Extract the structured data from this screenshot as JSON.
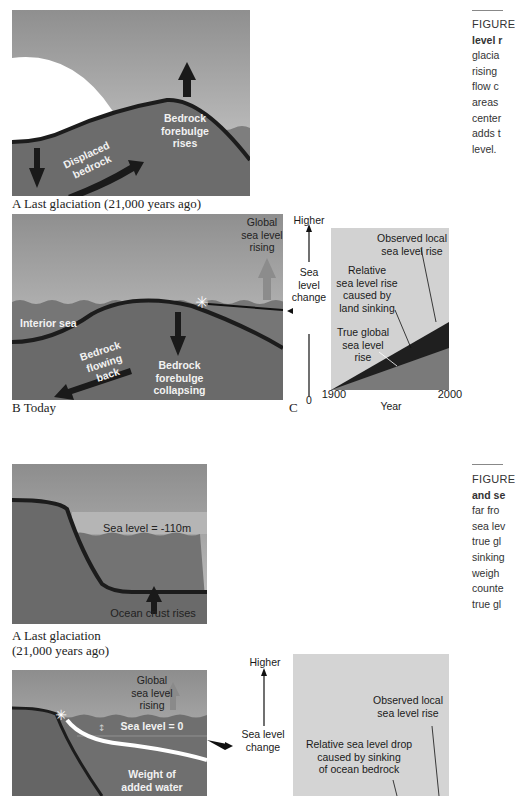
{
  "figure_top": {
    "panel_a": {
      "labels": {
        "forebulge": [
          "Bedrock",
          "forebulge",
          "rises"
        ],
        "displaced": [
          "Displaced",
          "bedrock"
        ]
      },
      "caption": "A  Last glaciation (21,000 years ago)"
    },
    "panel_b": {
      "labels": {
        "global_rise": [
          "Global",
          "sea level",
          "rising"
        ],
        "interior_sea": "Interior sea",
        "flowing_back": [
          "Bedrock",
          "flowing",
          "back"
        ],
        "collapsing": [
          "Bedrock",
          "forebulge",
          "collapsing"
        ]
      },
      "caption": "B  Today"
    },
    "panel_c": {
      "caption": "C",
      "axis_top": "Higher",
      "axis_label": [
        "Sea",
        "level",
        "change"
      ],
      "axis_zero": "0",
      "x_start": "1900",
      "x_end": "2000",
      "x_label": "Year",
      "annotations": {
        "observed": [
          "Observed local",
          "sea level rise"
        ],
        "relative": [
          "Relative",
          "sea level rise",
          "caused by",
          "land sinking"
        ],
        "true_global": [
          "True global",
          "sea level",
          "rise"
        ]
      }
    },
    "side_caption": {
      "title": "FIGURE",
      "lines": [
        "level r",
        "glacia",
        "rising",
        "flow c",
        "areas",
        "center",
        "adds t",
        "level."
      ]
    }
  },
  "figure_bottom": {
    "panel_a": {
      "labels": {
        "sea_level": "Sea level = -110m",
        "crust": "Ocean crust rises"
      },
      "caption_lines": [
        "A  Last glaciation",
        "(21,000 years ago)"
      ]
    },
    "panel_b": {
      "labels": {
        "global_rise": [
          "Global",
          "sea level",
          "rising"
        ],
        "sea_level": "Sea level = 0",
        "weight": [
          "Weight of",
          "added water"
        ]
      }
    },
    "panel_c": {
      "axis_top": "Higher",
      "axis_label": [
        "Sea level",
        "change"
      ],
      "annotations": {
        "observed": [
          "Observed local",
          "sea level rise"
        ],
        "relative_drop": [
          "Relative sea level drop",
          "caused by sinking",
          "of ocean bedrock"
        ]
      }
    },
    "side_caption": {
      "title": "FIGURE",
      "lines": [
        "and se",
        "far fro",
        "sea lev",
        "true gl",
        "sinking",
        "weigh",
        "counte",
        "true gl"
      ]
    }
  },
  "colors": {
    "sky": "#a7a7a7",
    "sky_light": "#c9c9c9",
    "ice": "#ffffff",
    "bedrock": "#6e6e6e",
    "sea": "#8a8a8a",
    "dark": "#1e1e1e",
    "chart_bg": "#d2d2d2",
    "chart_true": "#7a7a7a",
    "chart_relative": "#1f1f1f"
  }
}
